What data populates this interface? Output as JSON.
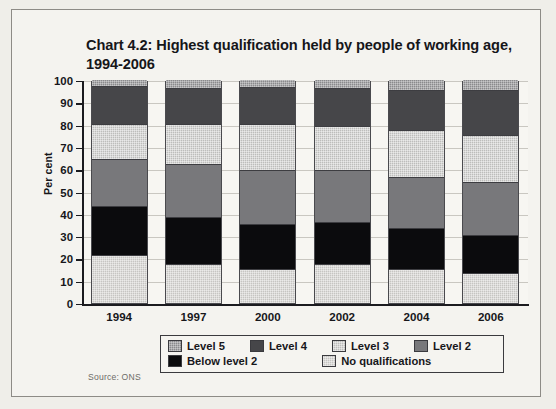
{
  "chart_data": {
    "type": "bar",
    "subtype": "stacked-100-percent",
    "title": "Chart 4.2: Highest qualification held by people of working age, 1994-2006",
    "xlabel": "",
    "ylabel": "Per cent",
    "ylim": [
      0,
      100
    ],
    "ytick_step": 10,
    "ytick_labels": [
      "100",
      "90",
      "80",
      "70",
      "60",
      "50",
      "40",
      "30",
      "20",
      "10",
      "0"
    ],
    "grid": true,
    "legend_position": "below-plot",
    "categories": [
      "1994",
      "1997",
      "2000",
      "2002",
      "2004",
      "2006"
    ],
    "series": [
      {
        "name": "Level 5",
        "color": "#8a8a8c",
        "values": [
          3,
          4,
          3.5,
          4,
          5,
          5
        ]
      },
      {
        "name": "Level 4",
        "color": "#464649",
        "values": [
          17,
          16,
          16.5,
          17,
          18,
          20
        ]
      },
      {
        "name": "Level 3",
        "color": "#bdbdbb",
        "values": [
          16,
          18,
          21,
          20,
          21,
          21
        ]
      },
      {
        "name": "Level 2",
        "color": "#78787b",
        "values": [
          21,
          24,
          24,
          23,
          23,
          24
        ]
      },
      {
        "name": "Below level 2",
        "color": "#0b0b0d",
        "values": [
          22,
          21,
          20,
          19,
          18,
          17
        ]
      },
      {
        "name": "No qualifications",
        "color": "#c6c5c2",
        "values": [
          21,
          17,
          15,
          17,
          15,
          13
        ]
      }
    ],
    "stack_order_bottom_to_top": [
      "No qualifications",
      "Below level 2",
      "Level 2",
      "Level 3",
      "Level 4",
      "Level 5"
    ],
    "source": "Source: ONS"
  },
  "legend": {
    "rows": [
      [
        {
          "label": "Level 5",
          "swatch": "fill-l5"
        },
        {
          "label": "Level 4",
          "swatch": "fill-l4"
        },
        {
          "label": "Level 3",
          "swatch": "fill-l3"
        },
        {
          "label": "Level 2",
          "swatch": "fill-l2"
        }
      ],
      [
        {
          "label": "Below level 2",
          "swatch": "fill-bl2"
        },
        {
          "label": "No qualifications",
          "swatch": "fill-nq"
        }
      ]
    ]
  }
}
